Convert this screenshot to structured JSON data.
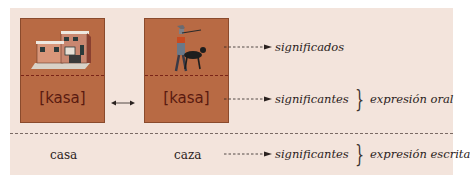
{
  "diagram": {
    "boxes": [
      {
        "id": "casa",
        "image": "house-illustration",
        "pronunciation": "[kasa]"
      },
      {
        "id": "caza",
        "image": "hunter-with-dog-illustration",
        "pronunciation": "[kasa]"
      }
    ],
    "written_words": [
      "casa",
      "caza"
    ],
    "rows": [
      {
        "label": "significados",
        "group": ""
      },
      {
        "label": "significantes",
        "group": "expresión oral"
      },
      {
        "label": "significantes",
        "group": "expresión escrita"
      }
    ],
    "colors": {
      "panel_bg": "#f3e4dc",
      "box_fill": "#b86a44",
      "text_dark": "#5a1a10"
    }
  }
}
